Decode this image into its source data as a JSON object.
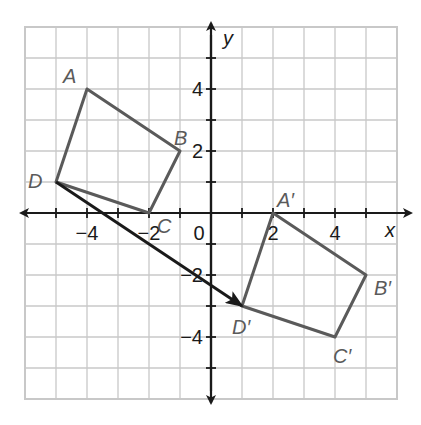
{
  "figure": {
    "axes": {
      "x_label": "x",
      "y_label": "y",
      "x_range": [
        -6,
        6
      ],
      "y_range": [
        -6,
        6
      ],
      "x_tick_labels": [
        {
          "value": -4,
          "text": "−4"
        },
        {
          "value": -2,
          "text": "−2"
        },
        {
          "value": 2,
          "text": "2"
        },
        {
          "value": 4,
          "text": "4"
        }
      ],
      "y_tick_labels": [
        {
          "value": 4,
          "text": "4"
        },
        {
          "value": 2,
          "text": "2"
        },
        {
          "value": -2,
          "text": "−2"
        },
        {
          "value": -4,
          "text": "−4"
        }
      ],
      "origin_label": "0"
    },
    "original_quad": {
      "name": "ABCD",
      "vertices": [
        {
          "label": "A",
          "x": -4,
          "y": 4
        },
        {
          "label": "B",
          "x": -1,
          "y": 2
        },
        {
          "label": "C",
          "x": -2,
          "y": 0
        },
        {
          "label": "D",
          "x": -5,
          "y": 1
        }
      ]
    },
    "image_quad": {
      "name": "A'B'C'D'",
      "vertices": [
        {
          "label": "A′",
          "x": 2,
          "y": 0
        },
        {
          "label": "B′",
          "x": 5,
          "y": -2
        },
        {
          "label": "C′",
          "x": 4,
          "y": -4
        },
        {
          "label": "D′",
          "x": 1,
          "y": -3
        }
      ]
    },
    "translation_vector": {
      "from": {
        "x": -5,
        "y": 1
      },
      "to": {
        "x": 1,
        "y": -3
      }
    },
    "colors": {
      "shape": "#5a5a5a",
      "axis": "#1a1a1a",
      "grid": "#c8c8c8"
    }
  }
}
